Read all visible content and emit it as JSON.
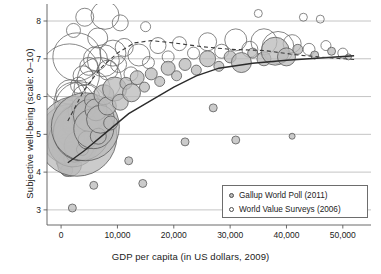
{
  "chart_data": {
    "type": "scatter",
    "title": "",
    "xlabel": "GDP per capita (in US dollars, 2009)",
    "ylabel": "Subjective well-being (scale: 0–10)",
    "xlim": [
      -2500,
      55000
    ],
    "ylim": [
      2.6,
      8.45
    ],
    "xticks": [
      0,
      10000,
      20000,
      30000,
      40000,
      50000
    ],
    "xticklabels": [
      "0",
      "10,000",
      "20,000",
      "30,000",
      "40,000",
      "50,000"
    ],
    "yticks": [
      3,
      4,
      5,
      6,
      7,
      8
    ],
    "yticklabels": [
      "3",
      "4",
      "5",
      "6",
      "7",
      "8"
    ],
    "grid": "horizontal",
    "legend_position": "lower-right",
    "colors": {
      "gallup_fill": "#b9b9b9",
      "gallup_stroke": "#5a5a5a",
      "wvs_fill": "#ffffff",
      "wvs_stroke": "#6a6a6a",
      "grid": "#b5b5b5",
      "frame": "#5a5a5a",
      "trend_gallup": "#2b2b2b",
      "trend_wvs": "#3a3a3a"
    },
    "legend": [
      {
        "label": "Gallup World Poll (2011)",
        "marker": "filled-circle",
        "series": "gallup"
      },
      {
        "label": "World Value Surveys (2006)",
        "marker": "open-circle",
        "series": "wvs"
      }
    ],
    "series": [
      {
        "name": "Gallup World Poll (2011)",
        "marker": "bubble-filled",
        "note": "bubble area scaled by population; x = GDP per capita, y = subjective well-being",
        "points": [
          [
            700,
            4.3,
            9
          ],
          [
            900,
            4.55,
            14
          ],
          [
            1000,
            4.05,
            6
          ],
          [
            1100,
            4.75,
            10
          ],
          [
            1200,
            5.05,
            22
          ],
          [
            1250,
            4.45,
            7
          ],
          [
            1350,
            4.9,
            16
          ],
          [
            1400,
            5.3,
            8
          ],
          [
            1500,
            4.2,
            12
          ],
          [
            1600,
            5.0,
            30
          ],
          [
            1700,
            4.65,
            6
          ],
          [
            1800,
            5.45,
            11
          ],
          [
            1900,
            4.35,
            8
          ],
          [
            2000,
            5.15,
            18
          ],
          [
            2100,
            4.8,
            25
          ],
          [
            2200,
            5.55,
            7
          ],
          [
            2400,
            4.5,
            9
          ],
          [
            2600,
            5.25,
            13
          ],
          [
            2800,
            4.95,
            40
          ],
          [
            3000,
            5.6,
            10
          ],
          [
            3200,
            4.7,
            15
          ],
          [
            3400,
            5.35,
            8
          ],
          [
            3600,
            5.05,
            28
          ],
          [
            3800,
            4.6,
            6
          ],
          [
            4000,
            5.7,
            12
          ],
          [
            4300,
            5.2,
            34
          ],
          [
            4600,
            4.85,
            9
          ],
          [
            5000,
            5.5,
            16
          ],
          [
            5400,
            5.9,
            7
          ],
          [
            5800,
            5.15,
            20
          ],
          [
            6200,
            5.65,
            11
          ],
          [
            6600,
            4.95,
            8
          ],
          [
            7000,
            5.4,
            14
          ],
          [
            7600,
            6.05,
            10
          ],
          [
            8200,
            5.75,
            9
          ],
          [
            8800,
            5.3,
            7
          ],
          [
            9500,
            6.2,
            12
          ],
          [
            10500,
            5.85,
            8
          ],
          [
            11500,
            6.35,
            6
          ],
          [
            12500,
            6.1,
            9
          ],
          [
            13500,
            6.5,
            7
          ],
          [
            14800,
            6.25,
            5
          ],
          [
            16000,
            6.6,
            6
          ],
          [
            17500,
            6.4,
            5
          ],
          [
            19000,
            6.75,
            7
          ],
          [
            20500,
            6.55,
            5
          ],
          [
            22000,
            6.85,
            6
          ],
          [
            24000,
            6.7,
            5
          ],
          [
            26000,
            7.0,
            8
          ],
          [
            28000,
            6.8,
            5
          ],
          [
            30000,
            7.05,
            6
          ],
          [
            32000,
            6.9,
            10
          ],
          [
            34000,
            7.15,
            5
          ],
          [
            36000,
            7.0,
            7
          ],
          [
            38000,
            7.2,
            14
          ],
          [
            40000,
            7.05,
            9
          ],
          [
            42000,
            7.25,
            5
          ],
          [
            45000,
            7.1,
            4
          ],
          [
            48000,
            7.2,
            4
          ],
          [
            51000,
            7.05,
            3
          ],
          [
            2000,
            3.05,
            4
          ],
          [
            5800,
            3.65,
            4
          ],
          [
            12000,
            4.3,
            4
          ],
          [
            14500,
            3.7,
            4
          ],
          [
            22000,
            4.8,
            4
          ],
          [
            31000,
            4.85,
            4
          ],
          [
            41000,
            4.95,
            3
          ],
          [
            27000,
            5.7,
            4
          ]
        ]
      },
      {
        "name": "World Value Surveys (2006)",
        "marker": "bubble-open",
        "note": "unfilled bubbles; same axes",
        "points": [
          [
            800,
            4.95,
            8
          ],
          [
            1100,
            5.6,
            12
          ],
          [
            1400,
            5.25,
            9
          ],
          [
            1700,
            6.05,
            15
          ],
          [
            2000,
            4.7,
            7
          ],
          [
            2300,
            5.85,
            20
          ],
          [
            2700,
            5.4,
            11
          ],
          [
            3100,
            6.3,
            8
          ],
          [
            3500,
            5.7,
            26
          ],
          [
            3900,
            6.55,
            10
          ],
          [
            4400,
            5.95,
            14
          ],
          [
            4900,
            6.8,
            9
          ],
          [
            5500,
            6.2,
            18
          ],
          [
            6100,
            7.0,
            12
          ],
          [
            6800,
            6.45,
            22
          ],
          [
            7500,
            6.95,
            16
          ],
          [
            8300,
            6.7,
            10
          ],
          [
            9200,
            7.15,
            13
          ],
          [
            10200,
            6.85,
            8
          ],
          [
            11200,
            7.3,
            9
          ],
          [
            12400,
            6.6,
            7
          ],
          [
            13800,
            7.1,
            11
          ],
          [
            15500,
            6.9,
            6
          ],
          [
            17200,
            7.35,
            8
          ],
          [
            19000,
            7.05,
            6
          ],
          [
            21000,
            7.4,
            7
          ],
          [
            23500,
            7.15,
            6
          ],
          [
            26000,
            7.45,
            9
          ],
          [
            28500,
            7.2,
            7
          ],
          [
            31000,
            7.5,
            11
          ],
          [
            33500,
            7.25,
            8
          ],
          [
            36000,
            7.45,
            13
          ],
          [
            38500,
            7.3,
            16
          ],
          [
            41000,
            7.4,
            9
          ],
          [
            44000,
            7.25,
            6
          ],
          [
            47000,
            7.35,
            5
          ],
          [
            50000,
            7.15,
            5
          ],
          [
            4200,
            8.1,
            9
          ],
          [
            7800,
            8.15,
            14
          ],
          [
            2200,
            7.75,
            7
          ],
          [
            10500,
            7.95,
            8
          ],
          [
            15000,
            7.85,
            5
          ],
          [
            46000,
            8.05,
            4
          ],
          [
            1500,
            6.6,
            30
          ],
          [
            2800,
            7.05,
            24
          ],
          [
            6500,
            7.55,
            10
          ],
          [
            35000,
            8.2,
            4
          ],
          [
            43000,
            8.1,
            4
          ]
        ]
      }
    ],
    "trend_lines": [
      {
        "name": "Gallup trend",
        "style": "solid",
        "series": "gallup",
        "points": [
          [
            1200,
            4.25
          ],
          [
            4000,
            4.55
          ],
          [
            8000,
            5.05
          ],
          [
            12000,
            5.55
          ],
          [
            16000,
            5.9
          ],
          [
            20000,
            6.25
          ],
          [
            24000,
            6.55
          ],
          [
            28000,
            6.75
          ],
          [
            34000,
            6.88
          ],
          [
            40000,
            6.96
          ],
          [
            46000,
            7.02
          ],
          [
            52000,
            7.08
          ]
        ]
      },
      {
        "name": "World Value Surveys trend",
        "style": "dashed",
        "series": "wvs",
        "points": [
          [
            1200,
            5.35
          ],
          [
            4000,
            6.15
          ],
          [
            7000,
            6.75
          ],
          [
            10000,
            7.15
          ],
          [
            13000,
            7.42
          ],
          [
            16000,
            7.48
          ],
          [
            20000,
            7.42
          ],
          [
            25000,
            7.32
          ],
          [
            30000,
            7.25
          ],
          [
            36000,
            7.22
          ],
          [
            42000,
            7.1
          ],
          [
            48000,
            7.02
          ],
          [
            52000,
            6.98
          ]
        ]
      }
    ]
  }
}
